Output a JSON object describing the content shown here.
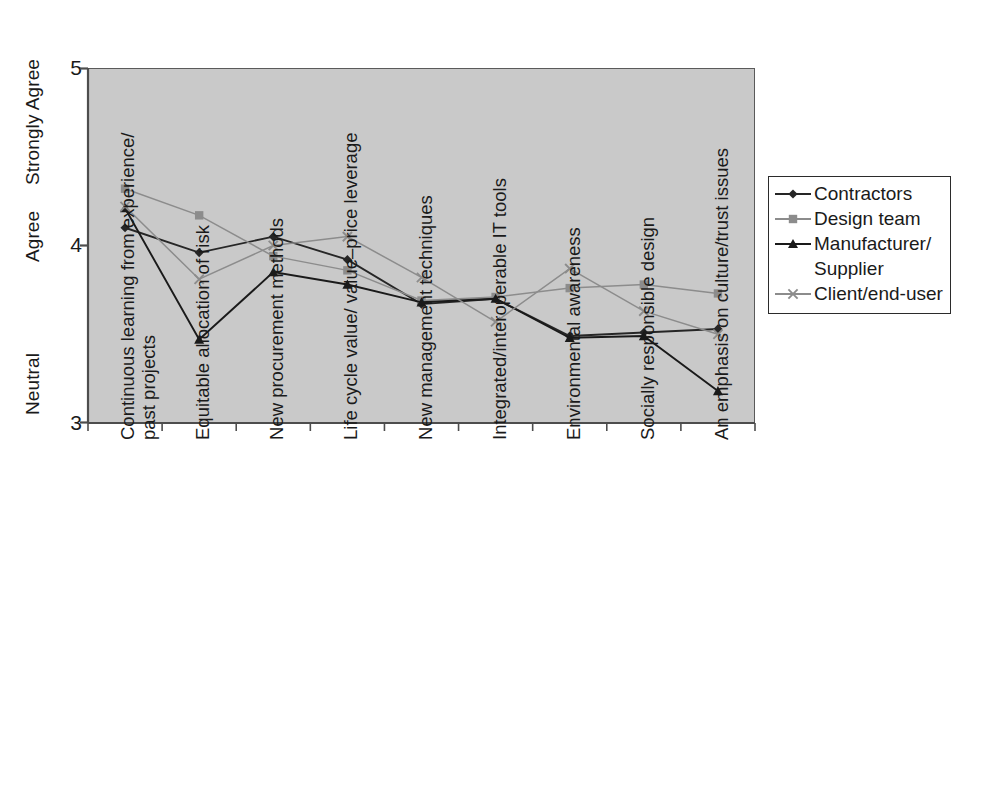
{
  "chart_data": {
    "type": "line",
    "title": "",
    "xlabel": "",
    "ylabel": "",
    "ylim": [
      3,
      5
    ],
    "grid": false,
    "legend_position": "right",
    "y_tick_values": [
      "3",
      "4",
      "5"
    ],
    "y_category_labels": [
      {
        "name": "strongly-agree",
        "text": "Strongly Agree",
        "value": 5
      },
      {
        "name": "agree",
        "text": "Agree",
        "value": 4
      },
      {
        "name": "neutral",
        "text": "Neutral",
        "value": 3
      }
    ],
    "categories": [
      "Continuous learning from experience/ past projects",
      "Equitable allocation of risk",
      "New procurement methods",
      "Life cycle value/ value–price leverage",
      "New management techniques",
      "Integrated/interoperable IT tools",
      "Environmental awareness",
      "Socially responsible design",
      "An emphasis on culture/trust issues"
    ],
    "categories_lines": [
      [
        "Continuous learning from experience/",
        "past projects"
      ],
      [
        "Equitable allocation of risk"
      ],
      [
        "New procurement methods"
      ],
      [
        "Life cycle value/ value–price leverage"
      ],
      [
        "New management techniques"
      ],
      [
        "Integrated/interoperable IT tools"
      ],
      [
        "Environmental awareness"
      ],
      [
        "Socially responsible design"
      ],
      [
        "An emphasis on culture/trust issues"
      ]
    ],
    "series": [
      {
        "name": "Contractors",
        "marker": "diamond",
        "color": "#262626",
        "values": [
          4.1,
          3.96,
          4.05,
          3.92,
          3.67,
          3.7,
          3.49,
          3.51,
          3.53
        ]
      },
      {
        "name": "Design team",
        "marker": "square",
        "color": "#8c8c8c",
        "values": [
          4.32,
          4.17,
          3.94,
          3.86,
          3.69,
          3.71,
          3.76,
          3.78,
          3.73
        ]
      },
      {
        "name": "Manufacturer/ Supplier",
        "marker": "triangle",
        "color": "#1a1a1a",
        "values": [
          4.21,
          3.47,
          3.85,
          3.78,
          3.68,
          3.7,
          3.48,
          3.49,
          3.18
        ]
      },
      {
        "name": "Client/end-user",
        "marker": "cross",
        "color": "#8c8c8c",
        "values": [
          4.22,
          3.81,
          4.0,
          4.05,
          3.82,
          3.57,
          3.87,
          3.63,
          3.5
        ]
      }
    ]
  },
  "legend": {
    "entries": [
      {
        "name": "contractors",
        "label": "Contractors",
        "marker": "diamond",
        "color": "#262626"
      },
      {
        "name": "design-team",
        "label": "Design team",
        "marker": "square",
        "color": "#8c8c8c"
      },
      {
        "name": "manufacturer-supplier",
        "label": "Manufacturer/",
        "label2": "Supplier",
        "marker": "triangle",
        "color": "#1a1a1a"
      },
      {
        "name": "client-end-user",
        "label": "Client/end-user",
        "marker": "cross",
        "color": "#8c8c8c"
      }
    ]
  },
  "colors": {
    "plot_background": "#c9c9c9",
    "axis": "#4d4d4d",
    "dark_series": "#262626",
    "grey_series": "#8c8c8c",
    "text": "#1a1a1a"
  }
}
